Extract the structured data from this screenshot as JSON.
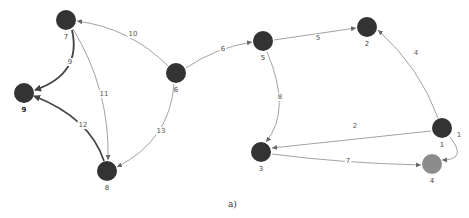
{
  "caption": "a)",
  "colors": {
    "node_default": "#333333",
    "node_highlight": "#8c8c8c",
    "edge": "#8a8a8a",
    "edge_thick": "#444444"
  },
  "nodes": [
    {
      "id": "1",
      "x": 442,
      "y": 128,
      "r": 10,
      "color": "#333333"
    },
    {
      "id": "2",
      "x": 367,
      "y": 27,
      "r": 10,
      "color": "#333333"
    },
    {
      "id": "3",
      "x": 261,
      "y": 152,
      "r": 10,
      "color": "#333333"
    },
    {
      "id": "4",
      "x": 432,
      "y": 164,
      "r": 10,
      "color": "#8c8c8c"
    },
    {
      "id": "5",
      "x": 263,
      "y": 41,
      "r": 10,
      "color": "#333333"
    },
    {
      "id": "6",
      "x": 176,
      "y": 73,
      "r": 10,
      "color": "#333333"
    },
    {
      "id": "7",
      "x": 66,
      "y": 20,
      "r": 10,
      "color": "#333333"
    },
    {
      "id": "8",
      "x": 107,
      "y": 171,
      "r": 10,
      "color": "#333333"
    },
    {
      "id": "9",
      "x": 24,
      "y": 93,
      "r": 10,
      "color": "#333333",
      "bold_label": true
    }
  ],
  "edges": [
    {
      "from": "6",
      "to": "7",
      "label": "10",
      "path": "M168,66 Q130,28 77,21",
      "lx": 133,
      "ly": 34
    },
    {
      "from": "7",
      "to": "9",
      "label": "9",
      "path": "M72,30 Q82,74 35,90",
      "lx": 70,
      "ly": 62,
      "thick": true
    },
    {
      "from": "7",
      "to": "8",
      "label": "11",
      "path": "M73,29 Q110,90 108,160",
      "lx": 104,
      "ly": 94
    },
    {
      "from": "8",
      "to": "9",
      "label": "12",
      "path": "M104,161 Q90,118 34,96",
      "lx": 83,
      "ly": 125,
      "thick": true
    },
    {
      "from": "6",
      "to": "8",
      "label": "13",
      "path": "M174,84 Q170,140 117,167",
      "lx": 161,
      "ly": 131
    },
    {
      "from": "6",
      "to": "5",
      "label": "6",
      "path": "M186,68 Q215,48 252,42",
      "lx": 223,
      "ly": 49
    },
    {
      "from": "5",
      "to": "2",
      "label": "5",
      "path": "M274,40 L356,28",
      "lx": 318,
      "ly": 38
    },
    {
      "from": "1",
      "to": "2",
      "label": "4",
      "path": "M438,118 Q420,68 378,30",
      "lx": 416,
      "ly": 53
    },
    {
      "from": "5",
      "to": "3",
      "label": "8",
      "path": "M267,52 Q292,110 266,142",
      "lx": 280,
      "ly": 97
    },
    {
      "from": "1",
      "to": "3",
      "label": "2",
      "path": "M431,131 L272,148",
      "lx": 355,
      "ly": 126
    },
    {
      "from": "3",
      "to": "4",
      "label": "7",
      "path": "M272,154 Q340,163 421,165",
      "lx": 348,
      "ly": 161
    },
    {
      "from": "1",
      "to": "4",
      "label": "1",
      "path": "M450,137 Q468,160 442,160",
      "lx": 459,
      "ly": 135
    }
  ]
}
